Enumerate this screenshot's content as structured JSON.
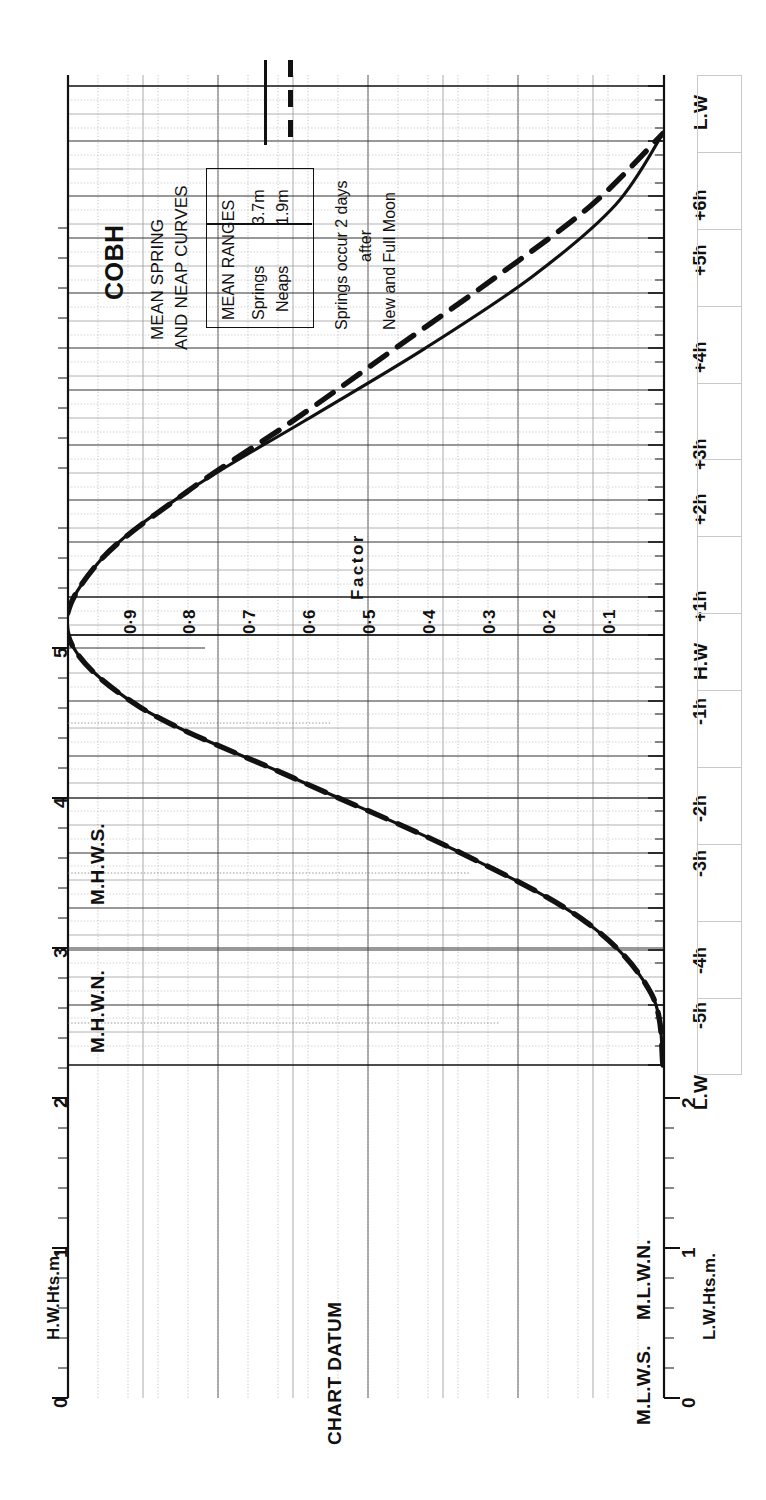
{
  "header": {
    "title": "COBH",
    "subtitle_line1": "MEAN SPRING",
    "subtitle_line2": "AND NEAP CURVES"
  },
  "legend": {
    "header": "MEAN RANGES",
    "rows": [
      {
        "label": "Springs",
        "value": "3.7m",
        "style": "solid"
      },
      {
        "label": "Neaps",
        "value": "1.9m",
        "style": "dashed"
      }
    ],
    "note_line1": "Springs occur 2 days",
    "note_line2": "after",
    "note_line3": "New and Full Moon"
  },
  "axes": {
    "left_label": "H.W.Hts.m.",
    "right_label": "L.W.Hts.m.",
    "datum_label": "CHART DATUM",
    "factor_label": "Factor",
    "left_ticks": [
      "0",
      "1",
      "2",
      "3",
      "4",
      "5"
    ],
    "right_ticks": [
      "0",
      "1",
      "2"
    ],
    "time_ticks": [
      "L.W",
      "-5h",
      "-4h",
      "-3h",
      "-2h",
      "-1h",
      "H.W",
      "+1h",
      "+2h",
      "+3h",
      "+4h",
      "+5h",
      "+6h",
      "L.W"
    ],
    "factor_ticks": [
      "0·9",
      "0·8",
      "0·7",
      "0·6",
      "0·5",
      "0·4",
      "0·3",
      "0·2",
      "0·1"
    ]
  },
  "levels": {
    "mhws": "M.H.W.S.",
    "mhwn": "M.H.W.N.",
    "mlwn": "M.L.W.N.",
    "mlws": "M.L.W.S."
  },
  "chart_data": {
    "type": "line",
    "xlabel": "Time relative to High Water",
    "ylabel": "Height (m) / Factor",
    "orientation": "rotated-90",
    "xlim": [
      -6,
      7
    ],
    "ylim": [
      0,
      1
    ],
    "grid": true,
    "legend_position": "top-left",
    "x": [
      -6,
      -5,
      -4,
      -3,
      -2,
      -1,
      0,
      1,
      2,
      3,
      4,
      5,
      6,
      7
    ],
    "series": [
      {
        "name": "Springs",
        "mean_range_m": 3.7,
        "style": "solid",
        "factors": [
          0.0,
          0.02,
          0.13,
          0.35,
          0.62,
          0.88,
          1.0,
          0.95,
          0.8,
          0.6,
          0.4,
          0.22,
          0.08,
          0.0
        ]
      },
      {
        "name": "Neaps",
        "mean_range_m": 1.9,
        "style": "dashed",
        "factors": [
          0.0,
          0.02,
          0.13,
          0.35,
          0.62,
          0.88,
          1.0,
          0.95,
          0.8,
          0.62,
          0.45,
          0.28,
          0.12,
          0.0
        ]
      }
    ],
    "reference_levels": [
      {
        "name": "M.H.W.S.",
        "height_m": 4.0,
        "axis": "left"
      },
      {
        "name": "M.H.W.N.",
        "height_m": 3.0,
        "axis": "left"
      },
      {
        "name": "M.L.W.N.",
        "height_m": 1.3,
        "axis": "right"
      },
      {
        "name": "M.L.W.S.",
        "height_m": 0.5,
        "axis": "right"
      },
      {
        "name": "CHART DATUM",
        "height_m": 0.0,
        "axis": "left"
      }
    ]
  },
  "blank_table": {
    "description": "blank tide-time entry column",
    "rows": 13
  }
}
